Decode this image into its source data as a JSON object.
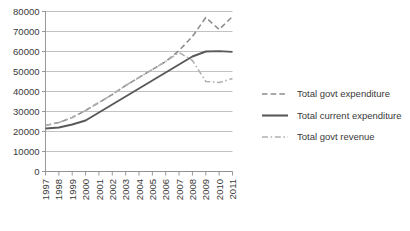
{
  "chart_data": {
    "type": "line",
    "title": "",
    "subtitle": "",
    "xlabel": "",
    "ylabel": "",
    "grid": true,
    "legend_position": "right",
    "ylim": [
      0,
      80000
    ],
    "ytick_labels": [
      "0",
      "10000",
      "20000",
      "30000",
      "40000",
      "50000",
      "60000",
      "70000",
      "80000"
    ],
    "ytick_values": [
      0,
      10000,
      20000,
      30000,
      40000,
      50000,
      60000,
      70000,
      80000
    ],
    "x": [
      "1997",
      "1998",
      "1999",
      "2000",
      "2001",
      "2002",
      "2003",
      "2004",
      "2005",
      "2006",
      "2007",
      "2008",
      "2009",
      "2010",
      "2011"
    ],
    "series": [
      {
        "name": "Total govt expenditure",
        "style": "dashed",
        "color": "#8c8c8c",
        "values": [
          23000,
          24500,
          27000,
          30500,
          34500,
          38500,
          43000,
          47000,
          51000,
          55000,
          60500,
          67500,
          77000,
          71000,
          77500
        ]
      },
      {
        "name": "Total current expenditure",
        "style": "solid",
        "color": "#595959",
        "values": [
          21500,
          22000,
          23500,
          25500,
          29500,
          33500,
          37500,
          41500,
          45500,
          49500,
          53500,
          57500,
          60000,
          60200,
          59800
        ]
      },
      {
        "name": "Total govt revenue",
        "style": "dashdot",
        "color": "#b0b0b0",
        "values": [
          23000,
          24500,
          27000,
          30500,
          34500,
          38500,
          43000,
          47000,
          51000,
          55000,
          59500,
          55500,
          45000,
          44500,
          46500
        ]
      }
    ]
  },
  "legend": {
    "items": [
      {
        "label": "Total govt expenditure",
        "marker": "dashed-line-marker"
      },
      {
        "label": "Total current expenditure",
        "marker": "solid-line-marker"
      },
      {
        "label": "Total govt revenue",
        "marker": "dashdot-line-marker"
      }
    ]
  },
  "colors": {
    "gridline": "#b3b3b3",
    "axis": "#8c8c8c",
    "text": "#3a3a3a",
    "background": "#ffffff"
  }
}
